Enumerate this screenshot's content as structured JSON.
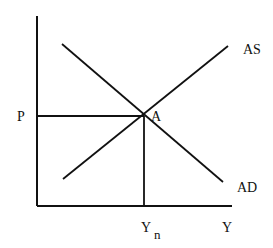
{
  "diagram": {
    "type": "AS-AD economic diagram",
    "colors": {
      "line": "#111111",
      "background": "#ffffff"
    },
    "axes": {
      "y_axis": {
        "x": 37,
        "y_top": 16,
        "y_bottom": 206
      },
      "x_axis": {
        "y": 206,
        "x_left": 37,
        "x_right": 232
      },
      "x_label": "Y",
      "y_level_label": "P"
    },
    "curves": {
      "as": {
        "label": "AS",
        "x1": 63,
        "y1": 179,
        "x2": 228,
        "y2": 46
      },
      "ad": {
        "label": "AD",
        "x1": 62,
        "y1": 44,
        "x2": 223,
        "y2": 182
      }
    },
    "equilibrium": {
      "label": "A",
      "x": 144,
      "y": 115,
      "output_label": "Y",
      "output_subscript": "n",
      "price_label": "P"
    }
  }
}
